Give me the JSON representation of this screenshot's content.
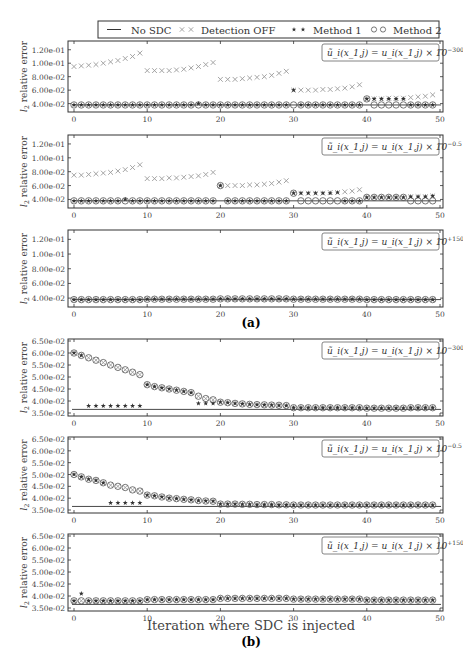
{
  "legend": {
    "items": [
      {
        "label": "No SDC",
        "marker": "line"
      },
      {
        "label": "Detection OFF",
        "marker": "x"
      },
      {
        "label": "Method 1",
        "marker": "star"
      },
      {
        "label": "Method 2",
        "marker": "circle"
      }
    ]
  },
  "captions": {
    "a": "(a)",
    "b": "(b)",
    "xlabel_b": "Iteration where SDC is injected"
  },
  "chart_data": [
    {
      "type": "scatter",
      "panel": "a1",
      "annotation": "ũ_i(x_{1,j}) = u_i(x_{1,j}) × 10^{-300}",
      "annotation_base": "ũ_i(x_1,j) = u_i(x_1,j) × 10",
      "annotation_exp": "−300",
      "ylabel": "l2 relative error",
      "ylim": [
        0.032,
        0.13
      ],
      "yticks": [
        0.04,
        0.06,
        0.08,
        0.1,
        0.12
      ],
      "ytick_labels": [
        "4.00e-02",
        "6.00e-02",
        "8.00e-02",
        "1.00e-01",
        "1.20e-01"
      ],
      "xlim": [
        0,
        50
      ],
      "xticks": [
        0,
        10,
        20,
        30,
        40,
        50
      ],
      "no_sdc": 0.038,
      "series": [
        {
          "name": "Detection OFF",
          "x": [
            0,
            1,
            2,
            3,
            4,
            5,
            6,
            7,
            8,
            9,
            10,
            11,
            12,
            13,
            14,
            15,
            16,
            17,
            18,
            19,
            20,
            21,
            22,
            23,
            24,
            25,
            26,
            27,
            28,
            29,
            30,
            31,
            32,
            33,
            34,
            35,
            36,
            37,
            38,
            39,
            40,
            41,
            42,
            43,
            44,
            45,
            46,
            47,
            48,
            49
          ],
          "values": [
            0.095,
            0.096,
            0.097,
            0.098,
            0.1,
            0.102,
            0.104,
            0.107,
            0.11,
            0.115,
            0.089,
            0.089,
            0.089,
            0.089,
            0.09,
            0.091,
            0.093,
            0.095,
            0.098,
            0.101,
            0.076,
            0.076,
            0.076,
            0.077,
            0.078,
            0.079,
            0.08,
            0.082,
            0.085,
            0.088,
            0.06,
            0.06,
            0.06,
            0.06,
            0.061,
            0.061,
            0.062,
            0.063,
            0.065,
            0.068,
            0.047,
            0.047,
            0.047,
            0.048,
            0.048,
            0.048,
            0.049,
            0.05,
            0.051,
            0.053
          ]
        },
        {
          "name": "Method 1",
          "values": [
            0.038,
            0.038,
            0.038,
            0.038,
            0.038,
            0.038,
            0.038,
            0.038,
            0.038,
            0.038,
            0.038,
            0.038,
            0.038,
            0.038,
            0.038,
            0.038,
            0.038,
            0.04,
            0.038,
            0.038,
            0.038,
            0.038,
            0.038,
            0.038,
            0.038,
            0.038,
            0.038,
            0.038,
            0.038,
            0.038,
            0.06,
            0.038,
            0.038,
            0.038,
            0.038,
            0.038,
            0.038,
            0.038,
            0.038,
            0.038,
            0.047,
            0.047,
            0.047,
            0.047,
            0.047,
            0.047,
            0.038,
            0.038,
            0.038,
            0.038
          ]
        },
        {
          "name": "Method 2",
          "values": [
            0.038,
            0.038,
            0.038,
            0.038,
            0.038,
            0.038,
            0.038,
            0.038,
            0.038,
            0.038,
            0.038,
            0.038,
            0.038,
            0.038,
            0.038,
            0.038,
            0.038,
            0.038,
            0.038,
            0.038,
            0.038,
            0.038,
            0.038,
            0.038,
            0.038,
            0.038,
            0.038,
            0.038,
            0.038,
            0.038,
            0.038,
            0.038,
            0.038,
            0.038,
            0.038,
            0.038,
            0.038,
            0.038,
            0.038,
            0.038,
            0.047,
            0.038,
            0.038,
            0.038,
            0.038,
            0.038,
            0.038,
            0.038,
            0.038,
            0.038
          ]
        }
      ]
    },
    {
      "type": "scatter",
      "panel": "a2",
      "annotation": "ũ_i(x_{1,j}) = u_i(x_{1,j}) × 10^{-0.5}",
      "annotation_base": "ũ_i(x_1,j) = u_i(x_1,j) × 10",
      "annotation_exp": "−0.5",
      "ylabel": "l2 relative error",
      "ylim": [
        0.032,
        0.13
      ],
      "yticks": [
        0.04,
        0.06,
        0.08,
        0.1,
        0.12
      ],
      "ytick_labels": [
        "4.00e-02",
        "6.00e-02",
        "8.00e-02",
        "1.00e-01",
        "1.20e-01"
      ],
      "xlim": [
        0,
        50
      ],
      "xticks": [
        0,
        10,
        20,
        30,
        40,
        50
      ],
      "no_sdc": 0.038,
      "series": [
        {
          "name": "Detection OFF",
          "values": [
            0.075,
            0.075,
            0.076,
            0.077,
            0.078,
            0.079,
            0.081,
            0.083,
            0.086,
            0.09,
            0.07,
            0.07,
            0.07,
            0.071,
            0.071,
            0.072,
            0.073,
            0.074,
            0.076,
            0.079,
            0.06,
            0.06,
            0.06,
            0.06,
            0.061,
            0.061,
            0.062,
            0.063,
            0.065,
            0.067,
            0.049,
            0.049,
            0.049,
            0.049,
            0.049,
            0.05,
            0.05,
            0.051,
            0.052,
            0.054,
            0.043,
            0.043,
            0.043,
            0.043,
            0.043,
            0.043,
            0.044,
            0.044,
            0.044,
            0.045
          ]
        },
        {
          "name": "Method 1",
          "values": [
            0.038,
            0.038,
            0.038,
            0.038,
            0.038,
            0.038,
            0.038,
            0.04,
            0.038,
            0.038,
            0.038,
            0.038,
            0.038,
            0.038,
            0.038,
            0.038,
            0.038,
            0.038,
            0.038,
            0.038,
            0.06,
            0.038,
            0.038,
            0.038,
            0.038,
            0.038,
            0.038,
            0.038,
            0.038,
            0.038,
            0.049,
            0.049,
            0.049,
            0.049,
            0.049,
            0.049,
            0.05,
            0.038,
            0.038,
            0.038,
            0.043,
            0.043,
            0.043,
            0.043,
            0.043,
            0.043,
            0.044,
            0.044,
            0.044,
            0.045
          ]
        },
        {
          "name": "Method 2",
          "values": [
            0.038,
            0.038,
            0.038,
            0.038,
            0.038,
            0.038,
            0.038,
            0.038,
            0.038,
            0.038,
            0.038,
            0.038,
            0.038,
            0.038,
            0.038,
            0.038,
            0.038,
            0.038,
            0.038,
            0.038,
            0.06,
            0.038,
            0.038,
            0.038,
            0.038,
            0.038,
            0.038,
            0.038,
            0.038,
            0.038,
            0.049,
            0.038,
            0.038,
            0.038,
            0.038,
            0.038,
            0.038,
            0.038,
            0.038,
            0.038,
            0.043,
            0.043,
            0.043,
            0.043,
            0.043,
            0.043,
            0.038,
            0.038,
            0.038,
            0.038
          ]
        }
      ]
    },
    {
      "type": "scatter",
      "panel": "a3",
      "annotation": "ũ_i(x_{1,j}) = u_i(x_{1,j}) × 10^{+150}",
      "annotation_base": "ũ_i(x_1,j) = u_i(x_1,j) × 10",
      "annotation_exp": "+150",
      "ylabel": "l2 relative error",
      "ylim": [
        0.032,
        0.13
      ],
      "yticks": [
        0.04,
        0.06,
        0.08,
        0.1,
        0.12
      ],
      "ytick_labels": [
        "4.00e-02",
        "6.00e-02",
        "8.00e-02",
        "1.00e-01",
        "1.20e-01"
      ],
      "xlim": [
        0,
        50
      ],
      "xticks": [
        0,
        10,
        20,
        30,
        40,
        50
      ],
      "no_sdc": 0.038,
      "series": [
        {
          "name": "Detection OFF",
          "values": [
            0.038,
            0.038,
            0.038,
            0.038,
            0.038,
            0.038,
            0.038,
            0.038,
            0.038,
            0.038,
            0.0385,
            0.0385,
            0.0385,
            0.0385,
            0.0385,
            0.0385,
            0.0385,
            0.0385,
            0.0385,
            0.0385,
            0.039,
            0.039,
            0.039,
            0.039,
            0.039,
            0.039,
            0.039,
            0.039,
            0.039,
            0.039,
            0.0385,
            0.0385,
            0.0385,
            0.0385,
            0.0385,
            0.0385,
            0.0385,
            0.0385,
            0.0385,
            0.0385,
            0.038,
            0.038,
            0.038,
            0.038,
            0.038,
            0.038,
            0.038,
            0.038,
            0.038,
            0.038
          ]
        },
        {
          "name": "Method 1",
          "values": "same as Detection OFF"
        },
        {
          "name": "Method 2",
          "values": "same as Detection OFF"
        }
      ]
    },
    {
      "type": "scatter",
      "panel": "b1",
      "annotation": "ũ_i(x_{1,j}) = u_i(x_{1,j}) × 10^{-300}",
      "annotation_base": "ũ_i(x_1,j) = u_i(x_1,j) × 10",
      "annotation_exp": "−300",
      "ylabel": "l2 relative error",
      "ylim": [
        0.035,
        0.065
      ],
      "yticks": [
        0.035,
        0.04,
        0.045,
        0.05,
        0.055,
        0.06,
        0.065
      ],
      "ytick_labels": [
        "3.50e-02",
        "4.00e-02",
        "4.50e-02",
        "5.00e-02",
        "5.50e-02",
        "6.00e-02",
        "6.50e-02"
      ],
      "xlim": [
        0,
        50
      ],
      "xticks": [
        0,
        10,
        20,
        30,
        40,
        50
      ],
      "no_sdc": 0.0365,
      "series": [
        {
          "name": "Detection OFF",
          "values": [
            0.06,
            0.059,
            0.058,
            0.057,
            0.056,
            0.055,
            0.054,
            0.053,
            0.052,
            0.051,
            0.0468,
            0.046,
            0.0455,
            0.045,
            0.0445,
            0.044,
            0.0435,
            0.042,
            0.041,
            0.0405,
            0.0395,
            0.0393,
            0.039,
            0.0388,
            0.0386,
            0.0385,
            0.0384,
            0.0383,
            0.0382,
            0.0381,
            0.0372,
            0.0372,
            0.0372,
            0.0372,
            0.0372,
            0.0372,
            0.0372,
            0.0372,
            0.0372,
            0.0372,
            0.037,
            0.037,
            0.037,
            0.037,
            0.037,
            0.037,
            0.0372,
            0.0372,
            0.0372,
            0.0372
          ]
        },
        {
          "name": "Method 1",
          "values": [
            0.06,
            0.059,
            0.038,
            0.038,
            0.038,
            0.038,
            0.038,
            0.038,
            0.038,
            0.038,
            0.0468,
            0.046,
            0.0455,
            0.045,
            0.0445,
            0.044,
            0.0435,
            0.039,
            0.039,
            0.039,
            0.0395,
            0.0393,
            0.039,
            0.0388,
            0.0386,
            0.0385,
            0.0384,
            0.0383,
            0.0382,
            0.0381,
            0.0372,
            0.0372,
            0.0372,
            0.0372,
            0.0372,
            0.0372,
            0.0372,
            0.0372,
            0.0372,
            0.0372,
            0.037,
            0.037,
            0.037,
            0.037,
            0.037,
            0.037,
            0.0372,
            0.0372,
            0.0372,
            0.0372
          ]
        },
        {
          "name": "Method 2",
          "values": "same as Detection OFF"
        }
      ]
    },
    {
      "type": "scatter",
      "panel": "b2",
      "annotation": "ũ_i(x_{1,j}) = u_i(x_{1,j}) × 10^{-0.5}",
      "annotation_base": "ũ_i(x_1,j) = u_i(x_1,j) × 10",
      "annotation_exp": "−0.5",
      "ylabel": "l2 relative error",
      "ylim": [
        0.035,
        0.065
      ],
      "yticks": [
        0.035,
        0.04,
        0.045,
        0.05,
        0.055,
        0.06,
        0.065
      ],
      "ytick_labels": [
        "3.50e-02",
        "4.00e-02",
        "4.50e-02",
        "5.00e-02",
        "5.50e-02",
        "6.00e-02",
        "6.50e-02"
      ],
      "xlim": [
        0,
        50
      ],
      "xticks": [
        0,
        10,
        20,
        30,
        40,
        50
      ],
      "no_sdc": 0.0365,
      "series": [
        {
          "name": "Detection OFF",
          "values": [
            0.05,
            0.049,
            0.048,
            0.0475,
            0.0465,
            0.0455,
            0.045,
            0.0445,
            0.0435,
            0.043,
            0.0413,
            0.041,
            0.0405,
            0.04,
            0.0398,
            0.0395,
            0.0393,
            0.039,
            0.0388,
            0.0387,
            0.0375,
            0.0375,
            0.0375,
            0.0374,
            0.0374,
            0.0373,
            0.0373,
            0.0373,
            0.0372,
            0.0372,
            0.0371,
            0.0371,
            0.0371,
            0.0371,
            0.0371,
            0.0371,
            0.0371,
            0.0371,
            0.0371,
            0.0371,
            0.0371,
            0.0371,
            0.0371,
            0.0371,
            0.0371,
            0.0371,
            0.0371,
            0.0371,
            0.0371,
            0.0371
          ]
        },
        {
          "name": "Method 1",
          "values": [
            0.05,
            0.049,
            0.048,
            0.0475,
            0.0465,
            0.038,
            0.038,
            0.038,
            0.038,
            0.038,
            0.0413,
            0.041,
            0.0405,
            0.04,
            0.0398,
            0.0395,
            0.0393,
            0.039,
            0.0388,
            0.0387,
            0.0375,
            0.0375,
            0.0375,
            0.0374,
            0.0374,
            0.0373,
            0.0373,
            0.0373,
            0.0372,
            0.0372,
            0.0371,
            0.0371,
            0.0371,
            0.0371,
            0.0371,
            0.0371,
            0.0371,
            0.0371,
            0.0371,
            0.0371,
            0.0371,
            0.0371,
            0.0371,
            0.0371,
            0.0371,
            0.0371,
            0.0371,
            0.0371,
            0.0371,
            0.0371
          ]
        },
        {
          "name": "Method 2",
          "values": "same as Detection OFF"
        }
      ]
    },
    {
      "type": "scatter",
      "panel": "b3",
      "annotation": "ũ_i(x_{1,j}) = u_i(x_{1,j}) × 10^{+150}",
      "annotation_base": "ũ_i(x_1,j) = u_i(x_1,j) × 10",
      "annotation_exp": "+150",
      "ylabel": "l2 relative error",
      "xlabel": "Iteration where SDC is injected",
      "ylim": [
        0.035,
        0.065
      ],
      "yticks": [
        0.035,
        0.04,
        0.045,
        0.05,
        0.055,
        0.06,
        0.065
      ],
      "ytick_labels": [
        "3.50e-02",
        "4.00e-02",
        "4.50e-02",
        "5.00e-02",
        "5.50e-02",
        "6.00e-02",
        "6.50e-02"
      ],
      "xlim": [
        0,
        50
      ],
      "xticks": [
        0,
        10,
        20,
        30,
        40,
        50
      ],
      "no_sdc": 0.0365,
      "series": [
        {
          "name": "Detection OFF",
          "values": [
            0.038,
            0.038,
            0.038,
            0.038,
            0.038,
            0.038,
            0.038,
            0.038,
            0.038,
            0.038,
            0.0385,
            0.0385,
            0.0385,
            0.0385,
            0.0385,
            0.0385,
            0.0385,
            0.0385,
            0.0385,
            0.0385,
            0.039,
            0.039,
            0.039,
            0.039,
            0.039,
            0.039,
            0.039,
            0.039,
            0.039,
            0.039,
            0.0387,
            0.0387,
            0.0387,
            0.0387,
            0.0387,
            0.0387,
            0.0387,
            0.0387,
            0.0387,
            0.0387,
            0.0383,
            0.0383,
            0.0383,
            0.0383,
            0.0383,
            0.0383,
            0.0383,
            0.0383,
            0.0383,
            0.0383
          ]
        },
        {
          "name": "Method 1",
          "values": [
            0.038,
            0.041,
            0.038,
            0.038,
            0.038,
            0.038,
            0.038,
            0.038,
            0.038,
            0.038,
            0.0385,
            0.0385,
            0.0385,
            0.0385,
            0.0385,
            0.0385,
            0.0385,
            0.0385,
            0.0385,
            0.0385,
            0.039,
            0.039,
            0.039,
            0.039,
            0.039,
            0.039,
            0.039,
            0.039,
            0.039,
            0.039,
            0.0387,
            0.0387,
            0.0387,
            0.0387,
            0.0387,
            0.0387,
            0.0387,
            0.0387,
            0.0387,
            0.0387,
            0.0383,
            0.0383,
            0.0383,
            0.0383,
            0.0383,
            0.0383,
            0.0383,
            0.0383,
            0.0383,
            0.0383
          ]
        },
        {
          "name": "Method 2",
          "values": "same as Detection OFF"
        }
      ]
    }
  ]
}
